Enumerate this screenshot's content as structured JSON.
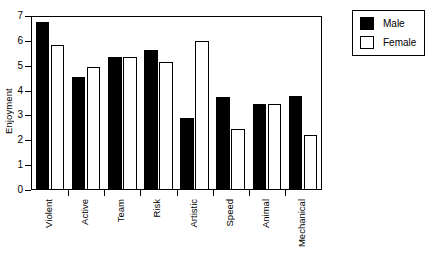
{
  "chart_data": {
    "type": "bar",
    "title": "",
    "xlabel": "",
    "ylabel": "Enjoyment",
    "ylim": [
      0,
      7
    ],
    "yticks": [
      0,
      1,
      2,
      3,
      4,
      5,
      6,
      7
    ],
    "grid": false,
    "legend_position": "right-outside",
    "categories": [
      "Violent",
      "Active",
      "Team",
      "Risk",
      "Artistic",
      "Speed",
      "Animal",
      "Mechanical"
    ],
    "series": [
      {
        "name": "Male",
        "color": "#000000",
        "values": [
          6.75,
          4.55,
          5.37,
          5.65,
          2.9,
          3.75,
          3.45,
          3.8
        ]
      },
      {
        "name": "Female",
        "color": "#ffffff",
        "values": [
          5.85,
          4.95,
          5.37,
          5.15,
          6.0,
          2.45,
          3.45,
          2.2
        ]
      }
    ]
  },
  "legend": {
    "entries": [
      {
        "label": "Male"
      },
      {
        "label": "Female"
      }
    ]
  },
  "caption": ""
}
